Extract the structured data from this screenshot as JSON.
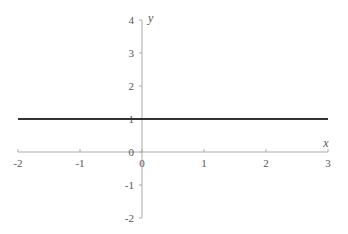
{
  "chart_data": {
    "type": "line",
    "title": "",
    "xlabel": "x",
    "ylabel": "y",
    "xlim": [
      -2,
      3
    ],
    "ylim": [
      -2,
      4
    ],
    "x_ticks": [
      -2,
      -1,
      0,
      1,
      2,
      3
    ],
    "y_ticks": [
      -2,
      -1,
      0,
      1,
      2,
      3,
      4
    ],
    "x_tick_labels": [
      "-2",
      "-1",
      "0",
      "1",
      "2",
      "3"
    ],
    "y_tick_labels": [
      "-2",
      "-1",
      "0",
      "1",
      "2",
      "3",
      "4"
    ],
    "grid": false,
    "legend": null,
    "series": [
      {
        "name": "y = 1",
        "x": [
          -2,
          3
        ],
        "y": [
          1,
          1
        ],
        "color": "#333333"
      }
    ]
  },
  "colors": {
    "axis": "#aaaaaa",
    "line": "#333333",
    "text": "#555555"
  }
}
